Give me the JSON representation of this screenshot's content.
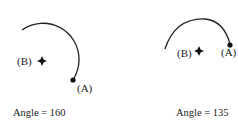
{
  "figures": [
    {
      "id": "left",
      "caption": "Angle = 160",
      "angle": 160,
      "center_label": "(B)",
      "point_label": "(A)",
      "center": [
        42,
        60
      ],
      "point_a": [
        73,
        80
      ],
      "arc_start": [
        22,
        28
      ]
    },
    {
      "id": "right",
      "caption": "Angle = 135",
      "angle": 135,
      "center_label": "(B)",
      "point_label": "(A)",
      "center": [
        198,
        62
      ],
      "point_a": [
        230,
        45
      ],
      "arc_start": [
        165,
        47
      ]
    }
  ],
  "colors": {
    "stroke": "#222222",
    "background": "#ffffff"
  }
}
